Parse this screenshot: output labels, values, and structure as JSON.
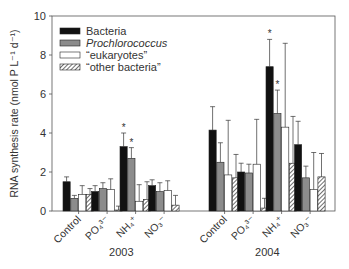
{
  "chart_data": {
    "type": "bar",
    "title": "",
    "xlabel": "",
    "ylabel": "RNA synthesis rate (nmol P L⁻¹ d⁻¹)",
    "ylim": [
      0,
      10
    ],
    "yticks": [
      0,
      2,
      4,
      6,
      8,
      10
    ],
    "grid": false,
    "legend_position": "upper-left",
    "groups": [
      {
        "label": "2003",
        "categories": [
          "Control",
          "PO₄³⁻",
          "NH₄⁺",
          "NO₃⁻"
        ]
      },
      {
        "label": "2004",
        "categories": [
          "Control",
          "PO₄³⁻",
          "NH₄⁺",
          "NO₃⁻"
        ]
      }
    ],
    "categories": [
      "2003 Control",
      "2003 PO4",
      "2003 NH4",
      "2003 NO3",
      "2004 Control",
      "2004 PO4",
      "2004 NH4",
      "2004 NO3"
    ],
    "series": [
      {
        "name": "Bacteria",
        "style": "black",
        "values": [
          1.5,
          1.0,
          3.3,
          1.3,
          4.15,
          2.0,
          7.4,
          3.4
        ],
        "errors": [
          0.25,
          0.3,
          0.7,
          0.3,
          1.2,
          0.45,
          1.4,
          1.2
        ]
      },
      {
        "name": "Prochlorococcus",
        "style": "gray",
        "italic": true,
        "values": [
          0.65,
          1.15,
          2.7,
          1.0,
          2.5,
          1.95,
          5.0,
          1.7
        ],
        "errors": [
          0.15,
          0.3,
          0.55,
          0.45,
          1.0,
          0.45,
          1.2,
          0.6
        ]
      },
      {
        "name": "“eukaryotes”",
        "style": "white",
        "values": [
          0.85,
          1.1,
          0.5,
          1.05,
          1.85,
          2.4,
          4.3,
          1.1
        ],
        "errors": [
          0.45,
          0.55,
          0.85,
          0.5,
          2.8,
          2.3,
          4.3,
          1.9
        ]
      },
      {
        "name": "“other bacteria”",
        "style": "hatched",
        "values": [
          0.85,
          0.05,
          0.6,
          0.3,
          1.7,
          0.15,
          2.45,
          1.75
        ],
        "errors": [
          0.3,
          0.2,
          0.9,
          0.5,
          1.2,
          0.5,
          2.4,
          1.2
        ]
      }
    ],
    "annotations": [
      {
        "text": "*",
        "group": "2003",
        "category": "NH4",
        "series": "Bacteria"
      },
      {
        "text": "*",
        "group": "2003",
        "category": "NH4",
        "series": "Prochlorococcus"
      },
      {
        "text": "*",
        "group": "2004",
        "category": "NH4",
        "series": "Bacteria"
      },
      {
        "text": "*",
        "group": "2004",
        "category": "NH4",
        "series": "Prochlorococcus"
      }
    ]
  },
  "colors": {
    "black": "#111111",
    "gray": "#8c8c8c",
    "white": "#ffffff",
    "axis": "#555555"
  }
}
